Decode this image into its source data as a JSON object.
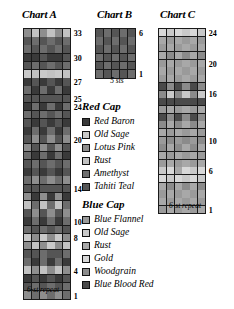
{
  "charts": [
    {
      "id": "chartA",
      "title": "Chart A",
      "caption": "6-st repeat",
      "cols": 6,
      "rows": 33,
      "cell_w": 7.2,
      "cell_h": 7.6,
      "row_labels": [
        {
          "row": 33,
          "text": "33"
        },
        {
          "row": 30,
          "text": "30"
        },
        {
          "row": 27,
          "text": "27"
        },
        {
          "row": 25,
          "text": "25"
        },
        {
          "row": 24,
          "text": "24"
        },
        {
          "row": 20,
          "text": "20"
        },
        {
          "row": 14,
          "text": "14"
        },
        {
          "row": 10,
          "text": "10"
        },
        {
          "row": 8,
          "text": "8"
        },
        {
          "row": 4,
          "text": "4"
        },
        {
          "row": 1,
          "text": "1"
        }
      ]
    },
    {
      "id": "chartB",
      "title": "Chart B",
      "caption": "5 sts",
      "cols": 5,
      "rows": 6,
      "cell_w": 7.4,
      "cell_h": 7.6,
      "row_labels": [
        {
          "row": 6,
          "text": "6"
        },
        {
          "row": 1,
          "text": "1"
        }
      ]
    },
    {
      "id": "chartC",
      "title": "Chart C",
      "caption": "6-st repeat",
      "cols": 6,
      "rows": 24,
      "cell_w": 7.2,
      "cell_h": 7.1,
      "row_labels": [
        {
          "row": 24,
          "text": "24"
        },
        {
          "row": 20,
          "text": "20"
        },
        {
          "row": 16,
          "text": "16"
        },
        {
          "row": 10,
          "text": "10"
        },
        {
          "row": 6,
          "text": "6"
        },
        {
          "row": 1,
          "text": "1"
        }
      ]
    }
  ],
  "legends": [
    {
      "id": "legendRed",
      "title": "Red Cap",
      "items": [
        {
          "label": "Red Baron",
          "color": "#3a3a3a"
        },
        {
          "label": "Old Sage",
          "color": "#c9c9c9"
        },
        {
          "label": "Lotus Pink",
          "color": "#8e8e8e"
        },
        {
          "label": "Rust",
          "color": "#c2c2c2"
        },
        {
          "label": "Amethyst",
          "color": "#6d6d6d"
        },
        {
          "label": "Tahiti Teal",
          "color": "#555555"
        }
      ]
    },
    {
      "id": "legendBlue",
      "title": "Blue Cap",
      "items": [
        {
          "label": "Blue Flannel",
          "color": "#9a9a9a"
        },
        {
          "label": "Old Sage",
          "color": "#c9c9c9"
        },
        {
          "label": "Rust",
          "color": "#a8a8a8"
        },
        {
          "label": "Gold",
          "color": "#d8d8d8"
        },
        {
          "label": "Woodgrain",
          "color": "#8b8b8b"
        },
        {
          "label": "Blue Blood Red",
          "color": "#4a4a4a"
        }
      ]
    }
  ],
  "chart_data": {
    "type": "heatmap",
    "grid": true,
    "palette": {
      "red_cap": [
        "#3a3a3a",
        "#c9c9c9",
        "#8e8e8e",
        "#c2c2c2",
        "#6d6d6d",
        "#555555"
      ],
      "blue_cap": [
        "#9a9a9a",
        "#c9c9c9",
        "#a8a8a8",
        "#d8d8d8",
        "#8b8b8b",
        "#4a4a4a"
      ]
    },
    "charts": [
      {
        "name": "Chart A",
        "xlabel": "6-st repeat",
        "ylabel": "row",
        "columns": 6,
        "rows": 33,
        "ylim": [
          1,
          33
        ],
        "yticks": [
          1,
          4,
          8,
          10,
          14,
          20,
          24,
          25,
          27,
          30,
          33
        ],
        "cells": [
          [
            "#8e8e8e",
            "#6d6d6d",
            "#8e8e8e",
            "#6d6d6d",
            "#8e8e8e",
            "#6d6d6d"
          ],
          [
            "#555555",
            "#6d6d6d",
            "#555555",
            "#6d6d6d",
            "#555555",
            "#6d6d6d"
          ],
          [
            "#3a3a3a",
            "#555555",
            "#3a3a3a",
            "#555555",
            "#3a3a3a",
            "#555555"
          ],
          [
            "#c2c2c2",
            "#8e8e8e",
            "#c2c2c2",
            "#8e8e8e",
            "#c2c2c2",
            "#8e8e8e"
          ],
          [
            "#6d6d6d",
            "#3a3a3a",
            "#6d6d6d",
            "#3a3a3a",
            "#6d6d6d",
            "#3a3a3a"
          ],
          [
            "#555555",
            "#555555",
            "#6d6d6d",
            "#555555",
            "#555555",
            "#6d6d6d"
          ],
          [
            "#8e8e8e",
            "#c2c2c2",
            "#8e8e8e",
            "#c9c9c9",
            "#8e8e8e",
            "#c2c2c2"
          ],
          [
            "#c9c9c9",
            "#8e8e8e",
            "#c9c9c9",
            "#8e8e8e",
            "#c9c9c9",
            "#8e8e8e"
          ],
          [
            "#6d6d6d",
            "#555555",
            "#6d6d6d",
            "#555555",
            "#6d6d6d",
            "#555555"
          ],
          [
            "#3a3a3a",
            "#6d6d6d",
            "#3a3a3a",
            "#6d6d6d",
            "#3a3a3a",
            "#6d6d6d"
          ],
          [
            "#555555",
            "#8e8e8e",
            "#555555",
            "#8e8e8e",
            "#555555",
            "#8e8e8e"
          ],
          [
            "#c2c2c2",
            "#6d6d6d",
            "#c2c2c2",
            "#6d6d6d",
            "#c2c2c2",
            "#6d6d6d"
          ],
          [
            "#8e8e8e",
            "#3a3a3a",
            "#8e8e8e",
            "#3a3a3a",
            "#8e8e8e",
            "#3a3a3a"
          ],
          [
            "#555555",
            "#555555",
            "#555555",
            "#555555",
            "#555555",
            "#555555"
          ],
          [
            "#6d6d6d",
            "#8e8e8e",
            "#6d6d6d",
            "#8e8e8e",
            "#6d6d6d",
            "#8e8e8e"
          ],
          [
            "#3a3a3a",
            "#555555",
            "#3a3a3a",
            "#555555",
            "#3a3a3a",
            "#555555"
          ],
          [
            "#555555",
            "#6d6d6d",
            "#555555",
            "#6d6d6d",
            "#555555",
            "#6d6d6d"
          ],
          [
            "#6d6d6d",
            "#3a3a3a",
            "#6d6d6d",
            "#3a3a3a",
            "#6d6d6d",
            "#3a3a3a"
          ],
          [
            "#8e8e8e",
            "#555555",
            "#8e8e8e",
            "#555555",
            "#8e8e8e",
            "#555555"
          ],
          [
            "#555555",
            "#8e8e8e",
            "#555555",
            "#8e8e8e",
            "#555555",
            "#8e8e8e"
          ],
          [
            "#3a3a3a",
            "#6d6d6d",
            "#3a3a3a",
            "#6d6d6d",
            "#3a3a3a",
            "#6d6d6d"
          ],
          [
            "#555555",
            "#3a3a3a",
            "#555555",
            "#3a3a3a",
            "#555555",
            "#3a3a3a"
          ],
          [
            "#6d6d6d",
            "#555555",
            "#6d6d6d",
            "#555555",
            "#6d6d6d",
            "#555555"
          ],
          [
            "#3a3a3a",
            "#6d6d6d",
            "#3a3a3a",
            "#6d6d6d",
            "#3a3a3a",
            "#6d6d6d"
          ],
          [
            "#555555",
            "#555555",
            "#555555",
            "#555555",
            "#555555",
            "#555555"
          ],
          [
            "#6d6d6d",
            "#3a3a3a",
            "#6d6d6d",
            "#3a3a3a",
            "#6d6d6d",
            "#3a3a3a"
          ],
          [
            "#3a3a3a",
            "#555555",
            "#3a3a3a",
            "#555555",
            "#3a3a3a",
            "#555555"
          ],
          [
            "#c9c9c9",
            "#c2c2c2",
            "#c9c9c9",
            "#c2c2c2",
            "#c9c9c9",
            "#c2c2c2"
          ],
          [
            "#555555",
            "#6d6d6d",
            "#555555",
            "#6d6d6d",
            "#555555",
            "#6d6d6d"
          ],
          [
            "#3a3a3a",
            "#3a3a3a",
            "#555555",
            "#3a3a3a",
            "#3a3a3a",
            "#555555"
          ],
          [
            "#6d6d6d",
            "#555555",
            "#6d6d6d",
            "#555555",
            "#6d6d6d",
            "#555555"
          ],
          [
            "#555555",
            "#6d6d6d",
            "#555555",
            "#6d6d6d",
            "#555555",
            "#6d6d6d"
          ],
          [
            "#8e8e8e",
            "#c2c2c2",
            "#8e8e8e",
            "#c2c2c2",
            "#8e8e8e",
            "#c2c2c2"
          ]
        ]
      },
      {
        "name": "Chart B",
        "xlabel": "5 sts",
        "ylabel": "row",
        "columns": 5,
        "rows": 6,
        "ylim": [
          1,
          6
        ],
        "yticks": [
          1,
          6
        ],
        "cells": [
          [
            "#6d6d6d",
            "#555555",
            "#6d6d6d",
            "#555555",
            "#6d6d6d"
          ],
          [
            "#555555",
            "#6d6d6d",
            "#555555",
            "#6d6d6d",
            "#555555"
          ],
          [
            "#6d6d6d",
            "#555555",
            "#6d6d6d",
            "#555555",
            "#6d6d6d"
          ],
          [
            "#555555",
            "#6d6d6d",
            "#555555",
            "#6d6d6d",
            "#555555"
          ],
          [
            "#6d6d6d",
            "#555555",
            "#6d6d6d",
            "#555555",
            "#6d6d6d"
          ],
          [
            "#555555",
            "#6d6d6d",
            "#555555",
            "#6d6d6d",
            "#555555"
          ]
        ]
      },
      {
        "name": "Chart C",
        "xlabel": "6-st repeat",
        "ylabel": "row",
        "columns": 6,
        "rows": 24,
        "ylim": [
          1,
          24
        ],
        "yticks": [
          1,
          6,
          10,
          16,
          20,
          24
        ],
        "cells": [
          [
            "#9a9a9a",
            "#a8a8a8",
            "#9a9a9a",
            "#a8a8a8",
            "#9a9a9a",
            "#a8a8a8"
          ],
          [
            "#a8a8a8",
            "#9a9a9a",
            "#a8a8a8",
            "#9a9a9a",
            "#a8a8a8",
            "#9a9a9a"
          ],
          [
            "#9a9a9a",
            "#a8a8a8",
            "#9a9a9a",
            "#a8a8a8",
            "#9a9a9a",
            "#a8a8a8"
          ],
          [
            "#a8a8a8",
            "#8b8b8b",
            "#a8a8a8",
            "#8b8b8b",
            "#a8a8a8",
            "#8b8b8b"
          ],
          [
            "#d8d8d8",
            "#c9c9c9",
            "#d8d8d8",
            "#c9c9c9",
            "#d8d8d8",
            "#c9c9c9"
          ],
          [
            "#c9c9c9",
            "#d8d8d8",
            "#a8a8a8",
            "#d8d8d8",
            "#c9c9c9",
            "#d8d8d8"
          ],
          [
            "#9a9a9a",
            "#a8a8a8",
            "#9a9a9a",
            "#a8a8a8",
            "#9a9a9a",
            "#a8a8a8"
          ],
          [
            "#a8a8a8",
            "#9a9a9a",
            "#a8a8a8",
            "#9a9a9a",
            "#a8a8a8",
            "#9a9a9a"
          ],
          [
            "#8b8b8b",
            "#a8a8a8",
            "#8b8b8b",
            "#a8a8a8",
            "#8b8b8b",
            "#a8a8a8"
          ],
          [
            "#9a9a9a",
            "#8b8b8b",
            "#9a9a9a",
            "#8b8b8b",
            "#9a9a9a",
            "#8b8b8b"
          ],
          [
            "#a8a8a8",
            "#9a9a9a",
            "#a8a8a8",
            "#9a9a9a",
            "#a8a8a8",
            "#9a9a9a"
          ],
          [
            "#8b8b8b",
            "#a8a8a8",
            "#8b8b8b",
            "#a8a8a8",
            "#8b8b8b",
            "#a8a8a8"
          ],
          [
            "#4a4a4a",
            "#8b8b8b",
            "#4a4a4a",
            "#8b8b8b",
            "#4a4a4a",
            "#8b8b8b"
          ],
          [
            "#9a9a9a",
            "#a8a8a8",
            "#9a9a9a",
            "#a8a8a8",
            "#9a9a9a",
            "#a8a8a8"
          ],
          [
            "#4a4a4a",
            "#4a4a4a",
            "#4a4a4a",
            "#4a4a4a",
            "#4a4a4a",
            "#4a4a4a"
          ],
          [
            "#8b8b8b",
            "#c9c9c9",
            "#8b8b8b",
            "#c9c9c9",
            "#8b8b8b",
            "#c9c9c9"
          ],
          [
            "#4a4a4a",
            "#8b8b8b",
            "#4a4a4a",
            "#8b8b8b",
            "#4a4a4a",
            "#8b8b8b"
          ],
          [
            "#9a9a9a",
            "#a8a8a8",
            "#9a9a9a",
            "#a8a8a8",
            "#9a9a9a",
            "#a8a8a8"
          ],
          [
            "#a8a8a8",
            "#9a9a9a",
            "#a8a8a8",
            "#9a9a9a",
            "#a8a8a8",
            "#9a9a9a"
          ],
          [
            "#9a9a9a",
            "#a8a8a8",
            "#9a9a9a",
            "#a8a8a8",
            "#9a9a9a",
            "#a8a8a8"
          ],
          [
            "#a8a8a8",
            "#8b8b8b",
            "#a8a8a8",
            "#8b8b8b",
            "#a8a8a8",
            "#8b8b8b"
          ],
          [
            "#9a9a9a",
            "#a8a8a8",
            "#9a9a9a",
            "#a8a8a8",
            "#9a9a9a",
            "#a8a8a8"
          ],
          [
            "#a8a8a8",
            "#9a9a9a",
            "#a8a8a8",
            "#9a9a9a",
            "#a8a8a8",
            "#9a9a9a"
          ],
          [
            "#d8d8d8",
            "#c9c9c9",
            "#d8d8d8",
            "#c9c9c9",
            "#d8d8d8",
            "#c9c9c9"
          ]
        ]
      }
    ]
  }
}
